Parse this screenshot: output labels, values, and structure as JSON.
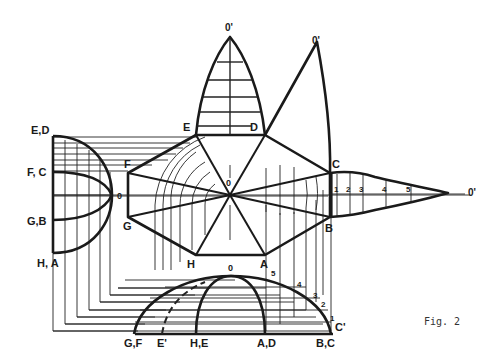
{
  "figure": {
    "caption": "Fig. 2"
  },
  "labels": {
    "side_elevation": {
      "ed": "E,D",
      "fc": "F, C",
      "gb": "G,B",
      "ha": "H, A",
      "o": "0"
    },
    "plan": {
      "e": "E",
      "d": "D",
      "f": "F",
      "c": "C",
      "g": "G",
      "b": "B",
      "h": "H",
      "a": "A",
      "center": "0"
    },
    "gores": {
      "apex_top": "0'",
      "apex_top_right": "0'",
      "apex_right": "0'",
      "divisions": [
        "1",
        "2",
        "3",
        "4",
        "5"
      ]
    },
    "front_elevation": {
      "o": "0",
      "gf": "G,F",
      "e_prime": "E'",
      "he": "H,E",
      "ad": "A,D",
      "bc": "B,C",
      "c_prime": "C'",
      "divisions": [
        "1",
        "2",
        "3",
        "4",
        "5"
      ]
    }
  }
}
